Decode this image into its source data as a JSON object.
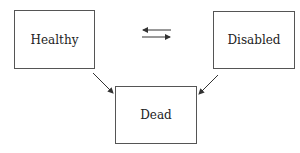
{
  "diagram": {
    "type": "state-transition",
    "nodes": [
      {
        "id": "healthy",
        "label": "Healthy"
      },
      {
        "id": "disabled",
        "label": "Disabled"
      },
      {
        "id": "dead",
        "label": "Dead"
      }
    ],
    "edges": [
      {
        "from": "healthy",
        "to": "disabled",
        "style": "arrow"
      },
      {
        "from": "disabled",
        "to": "healthy",
        "style": "arrow"
      },
      {
        "from": "healthy",
        "to": "dead",
        "style": "arrow"
      },
      {
        "from": "disabled",
        "to": "dead",
        "style": "arrow"
      }
    ],
    "colors": {
      "line": "#333333",
      "box_border": "#555555",
      "background": "#ffffff"
    }
  }
}
